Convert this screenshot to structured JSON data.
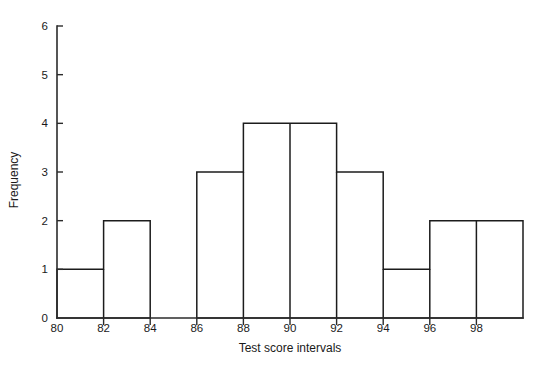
{
  "chart_data": {
    "type": "bar",
    "title": "",
    "subtitle": "",
    "xlabel": "Test score intervals",
    "ylabel": "Frequency",
    "xlim": [
      80,
      100
    ],
    "ylim": [
      0,
      6
    ],
    "grid": false,
    "legend": null,
    "bin_width": 2,
    "bin_edges": [
      80,
      82,
      84,
      86,
      88,
      90,
      92,
      94,
      96,
      98,
      100
    ],
    "categories": [
      "80-82",
      "82-84",
      "84-86",
      "86-88",
      "88-90",
      "90-92",
      "92-94",
      "94-96",
      "96-98",
      "98-100"
    ],
    "values": [
      1,
      2,
      0,
      3,
      4,
      4,
      3,
      1,
      2,
      2
    ],
    "x_tick_labels": [
      "80",
      "82",
      "84",
      "86",
      "88",
      "90",
      "92",
      "94",
      "96",
      "98"
    ],
    "x_tick_values": [
      80,
      82,
      84,
      86,
      88,
      90,
      92,
      94,
      96,
      98
    ],
    "y_tick_labels": [
      "0",
      "1",
      "2",
      "3",
      "4",
      "5",
      "6"
    ],
    "y_tick_values": [
      0,
      1,
      2,
      3,
      4,
      5,
      6
    ],
    "colors": {
      "background": "#ffffff",
      "bar_fill": "none",
      "bar_stroke": "#1c1c1c",
      "axis": "#2b2b2b",
      "text": "#1a1a1a"
    }
  },
  "axes": {
    "y_title": "Frequency",
    "x_title": "Test score intervals"
  }
}
